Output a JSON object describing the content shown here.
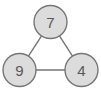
{
  "figure": {
    "type": "graph-diagram",
    "title": "",
    "background_color": "#ffffff",
    "width": 101,
    "height": 89
  },
  "style": {
    "node_fill": "#dcdcdc",
    "node_stroke": "#767676",
    "node_stroke_width": 1.4,
    "node_radius": 16.5,
    "edge_stroke": "#767676",
    "edge_stroke_width": 1.4,
    "label_color": "#58585a",
    "label_font_size": 15
  },
  "chart_data": {
    "type": "diagram",
    "layout": "triangle",
    "nodes": [
      {
        "id": "top",
        "label": "7",
        "cx": 50.5,
        "cy": 22.0
      },
      {
        "id": "bottom-left",
        "label": "9",
        "cx": 19.5,
        "cy": 70.0
      },
      {
        "id": "bottom-right",
        "label": "4",
        "cx": 81.5,
        "cy": 70.0
      }
    ],
    "edges": [
      {
        "id": "edge-top-bottom-left",
        "from": "top",
        "to": "bottom-left"
      },
      {
        "id": "edge-top-bottom-right",
        "from": "top",
        "to": "bottom-right"
      },
      {
        "id": "edge-bottom-left-bottom-right",
        "from": "bottom-left",
        "to": "bottom-right"
      }
    ]
  }
}
